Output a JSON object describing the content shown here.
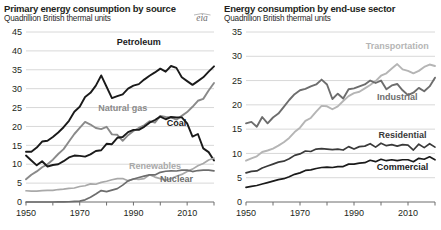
{
  "chart_data": [
    {
      "type": "line",
      "panel": "left",
      "title": "Primary energy consumption by source",
      "subtitle": "Quadrillion British thermal units",
      "xlabel": "",
      "ylabel": "",
      "grid": true,
      "legend_position": "inline-labels",
      "logo": "eia",
      "xlim": [
        1950,
        2020
      ],
      "ylim": [
        0,
        45
      ],
      "yticks": [
        0,
        5,
        10,
        15,
        20,
        25,
        30,
        35,
        40,
        45
      ],
      "xticks": [
        1950,
        1970,
        1990,
        2010
      ],
      "xminorticks": [
        1960,
        1980,
        2000,
        2020
      ],
      "x": [
        1950,
        1952,
        1954,
        1956,
        1958,
        1960,
        1962,
        1964,
        1966,
        1968,
        1970,
        1972,
        1974,
        1976,
        1978,
        1980,
        1982,
        1984,
        1986,
        1988,
        1990,
        1992,
        1994,
        1996,
        1998,
        2000,
        2002,
        2004,
        2006,
        2008,
        2010,
        2012,
        2014,
        2016,
        2018,
        2020
      ],
      "series": [
        {
          "name": "Petroleum",
          "color": "#1a1a1a",
          "width": 1.9,
          "label_x": 1992,
          "label_y": 41.5,
          "values": [
            13.3,
            13.3,
            14.4,
            16.0,
            16.2,
            17.2,
            18.4,
            19.8,
            21.5,
            23.9,
            25.2,
            27.8,
            28.9,
            30.8,
            33.5,
            30.5,
            27.5,
            28.0,
            28.5,
            30.0,
            30.8,
            31.2,
            32.4,
            33.4,
            34.3,
            35.3,
            34.5,
            36.0,
            35.5,
            33.0,
            32.0,
            31.0,
            32.0,
            33.0,
            34.5,
            35.9
          ]
        },
        {
          "name": "Natural gas",
          "color": "#8a8a8a",
          "width": 1.9,
          "label_x": 1986,
          "label_y": 24.0,
          "values": [
            6.0,
            7.2,
            8.1,
            9.2,
            10.0,
            11.2,
            12.7,
            14.0,
            16.0,
            18.0,
            19.6,
            21.2,
            20.5,
            19.6,
            19.3,
            19.9,
            17.9,
            17.8,
            16.2,
            17.7,
            18.8,
            19.6,
            20.3,
            21.4,
            21.0,
            22.8,
            22.5,
            22.4,
            21.8,
            22.8,
            23.8,
            25.2,
            26.8,
            27.3,
            29.5,
            31.5
          ]
        },
        {
          "name": "Coal",
          "color": "#1a1a1a",
          "width": 1.9,
          "label_x": 2006,
          "label_y": 20.0,
          "values": [
            12.3,
            11.0,
            9.7,
            10.8,
            9.4,
            9.8,
            10.0,
            10.8,
            11.8,
            12.3,
            12.2,
            12.0,
            12.6,
            13.5,
            13.7,
            15.4,
            15.3,
            17.0,
            17.2,
            18.5,
            19.1,
            19.1,
            19.9,
            21.0,
            21.7,
            22.6,
            21.9,
            22.5,
            22.4,
            22.4,
            20.8,
            17.3,
            18.0,
            14.2,
            13.2,
            11.0
          ]
        },
        {
          "name": "Renewables",
          "color": "#a9a9a9",
          "width": 1.7,
          "label_x": 1998,
          "label_y": 8.7,
          "values": [
            2.98,
            2.9,
            2.9,
            3.0,
            3.1,
            3.1,
            3.3,
            3.4,
            3.6,
            3.7,
            4.1,
            4.3,
            4.8,
            4.7,
            5.2,
            5.5,
            5.9,
            6.2,
            6.2,
            5.6,
            6.1,
            6.0,
            6.2,
            7.2,
            6.6,
            6.2,
            5.8,
            6.2,
            6.8,
            7.3,
            8.1,
            8.7,
            9.6,
            10.2,
            11.1,
            11.6
          ]
        },
        {
          "name": "Nuclear",
          "color": "#6d6d6d",
          "width": 1.7,
          "label_x": 2006,
          "label_y": 5.2,
          "values": [
            0.0,
            0.0,
            0.0,
            0.0,
            0.0,
            0.0,
            0.03,
            0.04,
            0.06,
            0.14,
            0.24,
            0.58,
            1.27,
            2.11,
            3.02,
            2.74,
            3.13,
            3.55,
            4.47,
            5.59,
            6.1,
            6.48,
            6.84,
            7.17,
            7.16,
            7.86,
            8.14,
            8.22,
            8.21,
            8.43,
            8.43,
            8.06,
            8.33,
            8.43,
            8.44,
            8.25
          ]
        }
      ]
    },
    {
      "type": "line",
      "panel": "right",
      "title": "Energy consumption by end-use sector",
      "subtitle": "Quadrillion British thermal units",
      "xlabel": "",
      "ylabel": "",
      "grid": true,
      "legend_position": "inline-labels",
      "xlim": [
        1950,
        2020
      ],
      "ylim": [
        0,
        35
      ],
      "yticks": [
        0,
        5,
        10,
        15,
        20,
        25,
        30,
        35
      ],
      "xticks": [
        1950,
        1970,
        1990,
        2010
      ],
      "xminorticks": [
        1960,
        1980,
        2000,
        2020
      ],
      "x": [
        1950,
        1952,
        1954,
        1956,
        1958,
        1960,
        1962,
        1964,
        1966,
        1968,
        1970,
        1972,
        1974,
        1976,
        1978,
        1980,
        1982,
        1984,
        1986,
        1988,
        1990,
        1992,
        1994,
        1996,
        1998,
        2000,
        2002,
        2004,
        2006,
        2008,
        2010,
        2012,
        2014,
        2016,
        2018,
        2020
      ],
      "series": [
        {
          "name": "Transportation",
          "color": "#b5b5b5",
          "width": 1.9,
          "label_x": 2006,
          "label_y": 31.5,
          "values": [
            8.5,
            9.0,
            9.4,
            10.3,
            10.6,
            11.0,
            11.6,
            12.3,
            13.2,
            14.4,
            15.3,
            16.7,
            17.3,
            18.6,
            19.8,
            19.7,
            19.1,
            19.7,
            20.8,
            21.8,
            22.4,
            22.7,
            23.4,
            24.1,
            24.9,
            26.0,
            26.5,
            27.5,
            28.4,
            27.3,
            27.0,
            26.5,
            27.0,
            27.8,
            28.3,
            28.0
          ]
        },
        {
          "name": "Industrial",
          "color": "#6d6d6d",
          "width": 1.9,
          "label_x": 2006,
          "label_y": 21.0,
          "values": [
            16.2,
            16.5,
            15.5,
            17.5,
            16.2,
            17.4,
            18.2,
            19.6,
            21.0,
            22.2,
            23.0,
            23.3,
            23.8,
            24.2,
            25.2,
            24.2,
            21.2,
            22.3,
            21.3,
            23.2,
            23.4,
            23.8,
            24.2,
            25.0,
            24.5,
            25.0,
            23.2,
            24.0,
            24.3,
            23.0,
            22.0,
            22.5,
            23.5,
            22.8,
            23.8,
            25.6
          ]
        },
        {
          "name": "Residential",
          "color": "#3a3a3a",
          "width": 1.7,
          "label_x": 2008,
          "label_y": 13.2,
          "values": [
            6.0,
            6.3,
            6.4,
            7.0,
            7.4,
            7.8,
            8.2,
            8.4,
            8.9,
            9.6,
            9.9,
            10.5,
            10.4,
            10.9,
            11.0,
            10.9,
            10.8,
            10.9,
            10.7,
            11.4,
            10.9,
            11.4,
            11.5,
            12.0,
            11.3,
            12.1,
            11.6,
            11.8,
            11.5,
            11.8,
            11.7,
            10.7,
            11.9,
            11.2,
            12.0,
            11.3
          ]
        },
        {
          "name": "Commercial",
          "color": "#1a1a1a",
          "width": 1.7,
          "label_x": 2008,
          "label_y": 6.6,
          "values": [
            3.0,
            3.2,
            3.4,
            3.7,
            4.0,
            4.3,
            4.6,
            4.8,
            5.2,
            5.7,
            6.0,
            6.5,
            6.6,
            6.9,
            7.1,
            7.2,
            7.1,
            7.3,
            7.3,
            7.8,
            7.8,
            8.0,
            8.1,
            8.6,
            8.3,
            8.8,
            8.5,
            8.7,
            8.5,
            8.7,
            8.7,
            8.3,
            9.0,
            8.8,
            9.3,
            8.7
          ]
        }
      ]
    }
  ]
}
